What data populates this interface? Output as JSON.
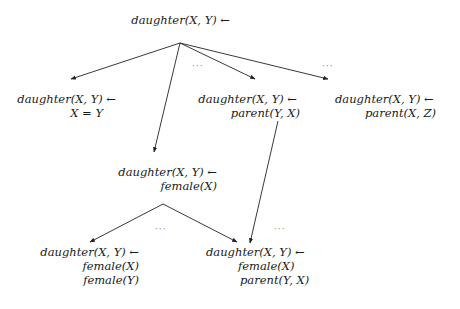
{
  "diagram": {
    "colors": {
      "edge": "#222222",
      "text": "#1a1a1a",
      "dots": "#888888"
    },
    "nodes": [
      {
        "id": "root",
        "lines": [
          "daughter(X, Y) ←"
        ]
      },
      {
        "id": "n1",
        "lines": [
          "daughter(X, Y) ←",
          "X = Y"
        ]
      },
      {
        "id": "n2",
        "lines": [
          "daughter(X, Y) ←",
          "parent(Y, X)"
        ]
      },
      {
        "id": "n3",
        "lines": [
          "daughter(X, Y) ←",
          "parent(X, Z)"
        ]
      },
      {
        "id": "n4",
        "lines": [
          "daughter(X, Y) ←",
          "female(X)"
        ]
      },
      {
        "id": "n5",
        "lines": [
          "daughter(X, Y) ←",
          "female(X)",
          "female(Y)"
        ]
      },
      {
        "id": "n6",
        "lines": [
          "daughter(X, Y) ←",
          "female(X)",
          "parent(Y, X)"
        ]
      }
    ],
    "edges": [
      {
        "from": "root",
        "to": "n1"
      },
      {
        "from": "root",
        "to": "n4"
      },
      {
        "from": "root",
        "to": "n2"
      },
      {
        "from": "root",
        "to": "n3"
      },
      {
        "from": "n4",
        "to": "n5"
      },
      {
        "from": "n4",
        "to": "n6"
      },
      {
        "from": "n2",
        "to": "n6"
      }
    ],
    "ellipses": [
      "···",
      "···",
      "···",
      "···"
    ]
  }
}
